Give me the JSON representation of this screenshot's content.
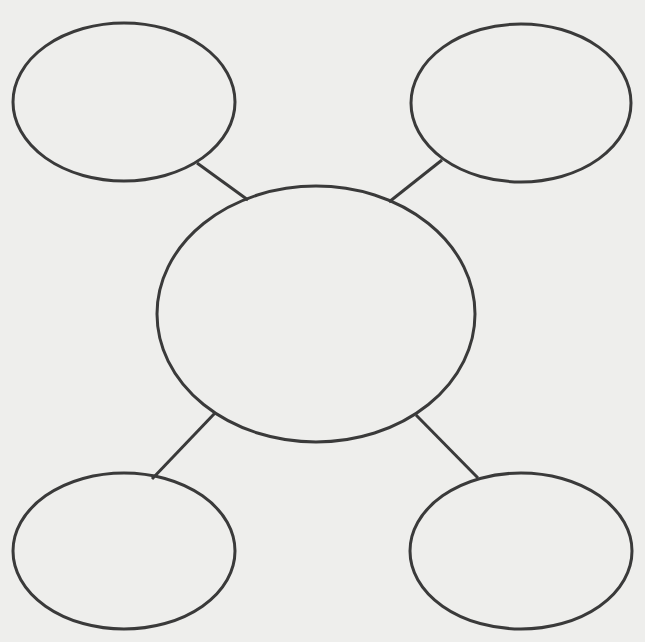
{
  "diagram": {
    "type": "bubble-map",
    "title": "",
    "background_color": "#eeeeec",
    "stroke_color": "#3a3a3a",
    "nodes": [
      {
        "id": "center",
        "label": ""
      },
      {
        "id": "top-left",
        "label": ""
      },
      {
        "id": "top-right",
        "label": ""
      },
      {
        "id": "bottom-left",
        "label": ""
      },
      {
        "id": "bottom-right",
        "label": ""
      }
    ],
    "edges": [
      {
        "from": "center",
        "to": "top-left"
      },
      {
        "from": "center",
        "to": "top-right"
      },
      {
        "from": "center",
        "to": "bottom-left"
      },
      {
        "from": "center",
        "to": "bottom-right"
      }
    ]
  }
}
